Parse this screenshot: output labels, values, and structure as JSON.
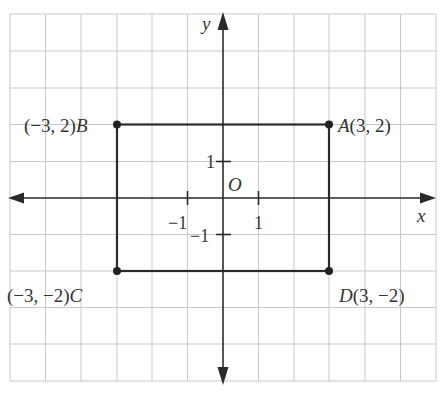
{
  "diagram": {
    "type": "coordinate-plane",
    "axes": {
      "x_label": "x",
      "y_label": "y",
      "origin_label": "O",
      "ticks": {
        "x_pos": "1",
        "x_neg": "−1",
        "y_pos": "1",
        "y_neg": "−1"
      }
    },
    "rectangle": {
      "points": [
        {
          "name": "A",
          "x": 3,
          "y": 2,
          "label_prefix": "",
          "label_name": "A",
          "label_coords": "(3, 2)"
        },
        {
          "name": "B",
          "x": -3,
          "y": 2,
          "label_coords": "(−3, 2)",
          "label_name": "B"
        },
        {
          "name": "C",
          "x": -3,
          "y": -2,
          "label_coords": "(−3, −2)",
          "label_name": "C"
        },
        {
          "name": "D",
          "x": 3,
          "y": -2,
          "label_name": "D",
          "label_coords": "(3, −2)"
        }
      ]
    },
    "grid": {
      "x_range": [
        -6,
        6
      ],
      "y_range": [
        -5,
        5
      ],
      "color": "#c9c9c9"
    },
    "colors": {
      "line": "#2a2a2a",
      "text": "#333333"
    }
  }
}
